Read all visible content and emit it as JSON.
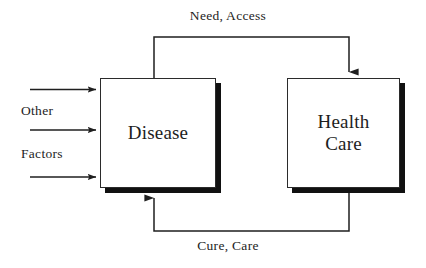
{
  "diagram": {
    "background_color": "#ffffff",
    "line_color": "#1f1f1f",
    "shadow_color": "#111111",
    "nodes": [
      {
        "id": "disease",
        "label": "Disease"
      },
      {
        "id": "health_care",
        "label_line1": "Health",
        "label_line2": "Care"
      }
    ],
    "edge_labels": {
      "top": "Need, Access",
      "bottom": "Cure, Care"
    },
    "input_labels": {
      "first": "Other",
      "second": "Factors"
    },
    "input_arrow_count": 3
  }
}
